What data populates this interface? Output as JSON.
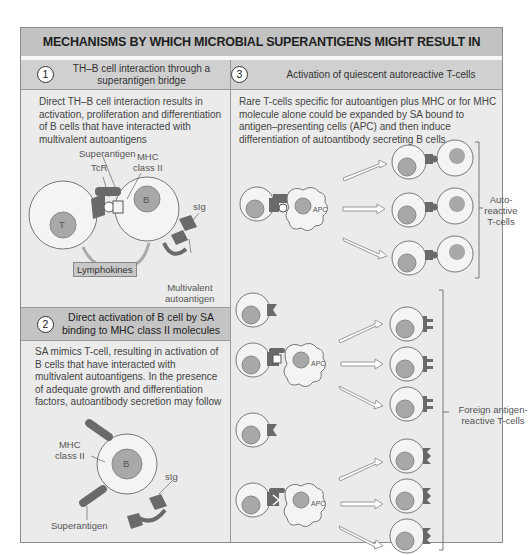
{
  "title": "MECHANISMS BY WHICH MICROBIAL SUPERANTIGENS MIGHT RESULT IN AUTOIMMUNITY",
  "panels": [
    {
      "number": "1",
      "heading_line1": "TH–B cell interaction through a",
      "heading_line2": "superantigen bridge",
      "description": "Direct TH–B cell interaction results in activation, proliferation and differentiation of B cells that have interacted with multivalent autoantigens",
      "labels": {
        "superantigen": "Superantigen",
        "tcr": "TcR",
        "mhc_line1": "MHC",
        "mhc_line2": "class II",
        "t_cell": "T",
        "b_cell": "B",
        "sig": "sIg",
        "lymphokines": "Lymphokines",
        "multivalent_line1": "Multivalent",
        "multivalent_line2": "autoantigen"
      }
    },
    {
      "number": "2",
      "heading_line1": "Direct activation of B cell by SA",
      "heading_line2": "binding to MHC class II molecules",
      "description": "SA mimics T-cell, resulting in activation of B cells that have interacted with multivalent autoantigens. In the presence of adequate growth and differentiation factors, autoantibody secretion may follow",
      "labels": {
        "mhc_line1": "MHC",
        "mhc_line2": "class II",
        "b_cell": "B",
        "sig": "sIg",
        "superantigen": "Superantigen"
      }
    },
    {
      "number": "3",
      "heading": "Activation of quiescent autoreactive T-cells",
      "description": "Rare T-cells specific for autoantigen plus MHC or for MHC molecule alone could be expanded by SA bound to antigen–presenting cells (APC) and then induce differentiation of autoantibody secreting B cells",
      "labels": {
        "t_cell": "T",
        "b_cell": "B",
        "apc": "APC",
        "autoreactive_line1": "Auto-",
        "autoreactive_line2": "reactive",
        "autoreactive_line3": "T-cells",
        "foreign_line1": "Foreign antigen-",
        "foreign_line2": "reactive T-cells"
      }
    }
  ],
  "colors": {
    "title_band": "#c2c2c2",
    "panel_bg": "#ebebeb",
    "header_band": "#d0d0d0",
    "nucleus": "#a8a8a8",
    "receptor_dark": "#6a6a6a",
    "lymphokine_box": "#c8c8c8"
  }
}
